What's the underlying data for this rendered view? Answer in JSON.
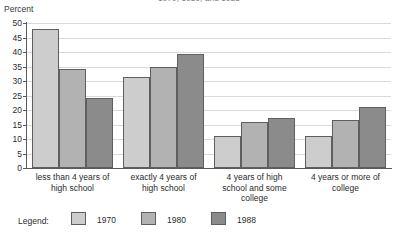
{
  "chart_data": {
    "type": "bar",
    "title": "1970, 1980, and 1988",
    "xlabel": "",
    "ylabel": "Percent",
    "ylim": [
      0,
      50
    ],
    "yticks": [
      0,
      5,
      10,
      15,
      20,
      25,
      30,
      35,
      40,
      45,
      50
    ],
    "grid": true,
    "legend_position": "bottom",
    "legend_title": "Legend:",
    "categories": [
      "less than 4 years of high school",
      "exactly 4 years of high school",
      "4 years of high school and some college",
      "4 years or more of college"
    ],
    "category_lines": [
      [
        "less than 4 years of",
        "high school"
      ],
      [
        "exactly 4 years of",
        "high school"
      ],
      [
        "4 years of high",
        "school and some",
        "college"
      ],
      [
        "4 years or more of",
        "college"
      ]
    ],
    "series": [
      {
        "name": "1970",
        "color": "#cdcdcd",
        "values": [
          48.0,
          31.5,
          11.0,
          11.1
        ]
      },
      {
        "name": "1980",
        "color": "#b2b2b2",
        "values": [
          34.0,
          35.0,
          16.0,
          16.6
        ]
      },
      {
        "name": "1988",
        "color": "#8b8b8b",
        "values": [
          24.0,
          39.4,
          17.3,
          21.0
        ]
      }
    ]
  },
  "axes": {
    "y_title": "Percent"
  }
}
